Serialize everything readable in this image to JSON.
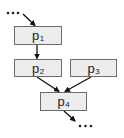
{
  "diagram": {
    "type": "flow",
    "nodes": [
      {
        "id": "p1",
        "base": "p",
        "subscript": "1",
        "box": [
          14,
          26,
          48,
          19
        ]
      },
      {
        "id": "p2",
        "base": "p",
        "subscript": "2",
        "box": [
          14,
          59,
          48,
          18
        ]
      },
      {
        "id": "p3",
        "base": "p",
        "subscript": "3",
        "box": [
          70,
          59,
          47,
          18
        ]
      },
      {
        "id": "p4",
        "base": "p",
        "subscript": "4",
        "box": [
          40,
          92,
          47,
          19
        ]
      }
    ],
    "edges": [
      {
        "from": "…",
        "to": "p1"
      },
      {
        "from": "p1",
        "to": "p2"
      },
      {
        "from": "p2",
        "to": "p4"
      },
      {
        "from": "p3",
        "to": "p4"
      },
      {
        "from": "p4",
        "to": "…"
      }
    ],
    "input_ellipsis": "•••",
    "output_ellipsis": "•••",
    "colors": {
      "box_fill": "#ececec",
      "box_border": "#6a6a6a",
      "arrow": "#111111"
    }
  }
}
